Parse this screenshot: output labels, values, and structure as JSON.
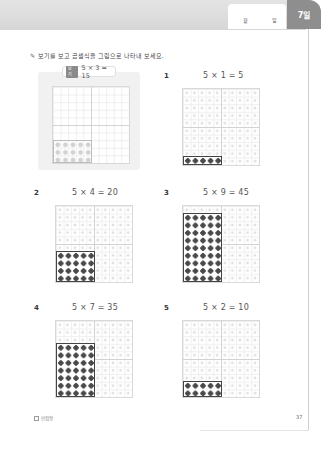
{
  "header": {
    "month_label": "월",
    "day_label": "일",
    "day_tab": "7일"
  },
  "instruction": {
    "icon": "pencil-icon",
    "text": "보기를 보고 곱셈식을 그림으로 나타내 보세요."
  },
  "example": {
    "tag": "보기",
    "equation": "5 × 3 = 15",
    "cols": 5,
    "rows": 3
  },
  "problems": [
    {
      "number": "1",
      "equation": "5 × 1 = 5",
      "cols": 5,
      "rows": 1
    },
    {
      "number": "2",
      "equation": "5 × 4 = 20",
      "cols": 5,
      "rows": 4
    },
    {
      "number": "3",
      "equation": "5 × 9 = 45",
      "cols": 5,
      "rows": 9
    },
    {
      "number": "4",
      "equation": "5 × 7 = 35",
      "cols": 5,
      "rows": 7
    },
    {
      "number": "5",
      "equation": "5 × 2 = 10",
      "cols": 5,
      "rows": 2
    }
  ],
  "footer": {
    "logo_text": "만점왕",
    "page_number": "37"
  },
  "colors": {
    "tab": "#8e8e8e",
    "dot_dark": "#4a4a4a",
    "dot_light": "#e0e0e0",
    "panel": "#f1f1f1"
  }
}
